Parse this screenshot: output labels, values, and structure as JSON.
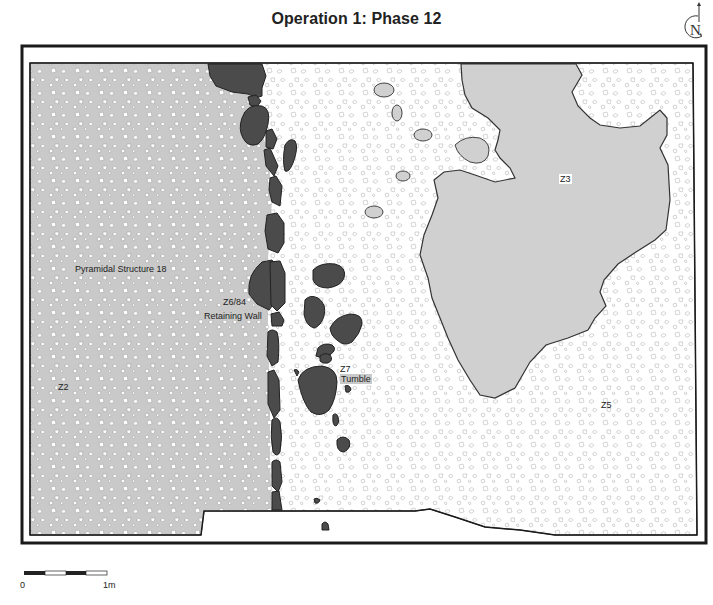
{
  "title": "Operation 1: Phase 12",
  "north_arrow": {
    "letter": "N",
    "icon": "north-arrow-icon"
  },
  "colors": {
    "structure_fill": "#c9c9c9",
    "stone_fill": "#4b4b4b",
    "z3_fill": "#d0d0d0",
    "frame": "#1a1a1a",
    "pebble_outline": "#bdbdbd"
  },
  "zones": {
    "z2": {
      "label": "Z2"
    },
    "pyramidal": {
      "label": "Pyramidal Structure 18"
    },
    "wall_id": {
      "label": "Z6/84"
    },
    "wall_name": {
      "label": "Retaining Wall"
    },
    "z7_id": {
      "label": "Z7"
    },
    "z7_name": {
      "label": "Tumble"
    },
    "z3": {
      "label": "Z3"
    },
    "z5": {
      "label": "Z5"
    }
  },
  "scale_bar": {
    "start_label": "0",
    "end_label": "1m"
  }
}
